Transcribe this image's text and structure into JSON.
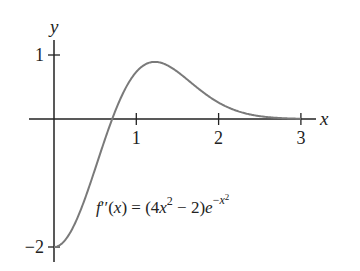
{
  "chart_data": {
    "type": "line",
    "title": "",
    "function_label": {
      "lhs": "f′′(x) = (4x",
      "exp1": "2",
      "mid": " − 2)e",
      "exp2": "−x",
      "exp2sup": "2"
    },
    "xlabel": "x",
    "ylabel": "y",
    "xlim": [
      -0.3,
      3.2
    ],
    "ylim": [
      -2.2,
      1.3
    ],
    "x_ticks": [
      1,
      2,
      3
    ],
    "x_tick_labels": [
      "1",
      "2",
      "3"
    ],
    "y_ticks": [
      1,
      -2
    ],
    "y_tick_labels": [
      "1",
      "−2"
    ],
    "grid": false,
    "legend": "none",
    "series": [
      {
        "name": "f''(x) = (4x^2 - 2)e^(-x^2)",
        "x": [
          0,
          0.25,
          0.5,
          0.707,
          0.75,
          1.0,
          1.225,
          1.5,
          1.75,
          2.0,
          2.5,
          3.0
        ],
        "values": [
          -2.0,
          -1.41,
          -0.78,
          0.0,
          0.14,
          0.74,
          0.89,
          0.74,
          0.49,
          0.26,
          0.05,
          0.0
        ]
      }
    ],
    "color": "#7a7a7a",
    "axis_color": "#222222"
  }
}
